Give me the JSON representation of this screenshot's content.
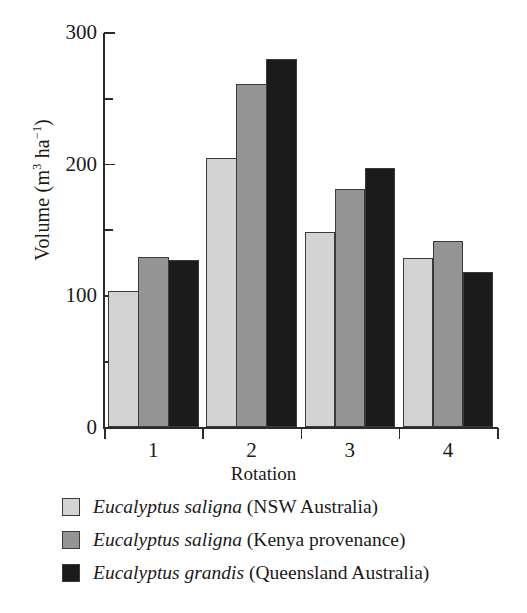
{
  "chart_data": {
    "type": "bar",
    "title": "",
    "xlabel": "Rotation",
    "ylabel": "Volume (m3 ha-1)",
    "ylabel_parts": {
      "prefix": "Volume (m",
      "sup1": "3",
      "mid": " ha",
      "sup2": "−1",
      "suffix": ")"
    },
    "categories": [
      "1",
      "2",
      "3",
      "4"
    ],
    "ylim": [
      0,
      300
    ],
    "yticks": [
      0,
      100,
      200,
      300
    ],
    "yticklabels": [
      "0",
      "100",
      "200",
      "300"
    ],
    "yminorticks": [
      50,
      150,
      250
    ],
    "grid": false,
    "legend_position": "below-axes",
    "series": [
      {
        "name": "Eucalyptus saligna (NSW Australia)",
        "name_italic": "Eucalyptus saligna",
        "name_rest": " (NSW Australia)",
        "color": "#d3d3d3",
        "values": [
          104,
          205,
          149,
          129
        ]
      },
      {
        "name": "Eucalyptus saligna (Kenya provenance)",
        "name_italic": "Eucalyptus saligna",
        "name_rest": " (Kenya provenance)",
        "color": "#949494",
        "values": [
          130,
          261,
          181,
          142
        ]
      },
      {
        "name": "Eucalyptus grandis (Queensland Australia)",
        "name_italic": "Eucalyptus grandis",
        "name_rest": " (Queensland Australia)",
        "color": "#1b1b1b",
        "values": [
          127,
          280,
          197,
          118
        ]
      }
    ]
  },
  "axes": {
    "y_axis_name": "volume-axis",
    "x_axis_name": "rotation-axis"
  }
}
